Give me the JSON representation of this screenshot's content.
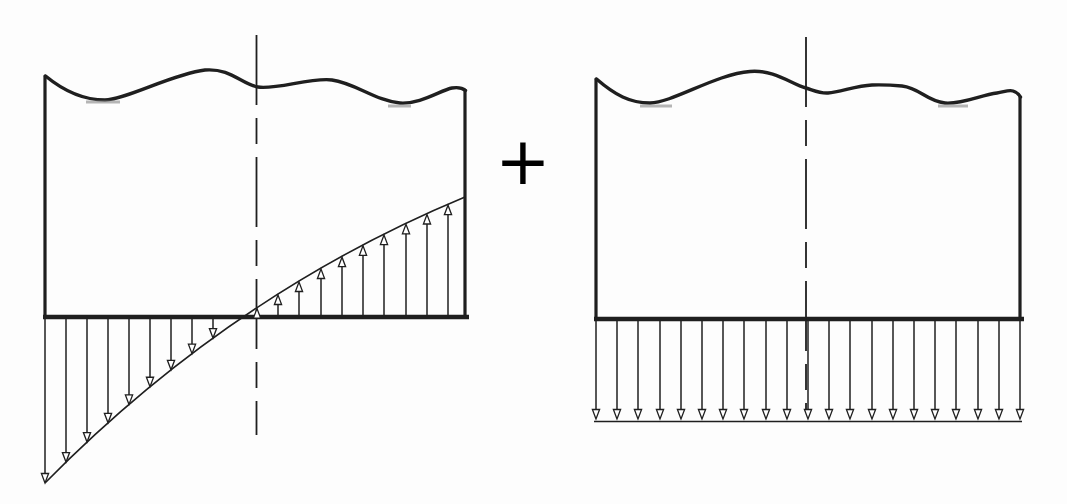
{
  "operator": {
    "label": "+"
  },
  "figure": {
    "bg": "#fdfdfd",
    "ink": "#1f1f1f",
    "faint": "#8f8f8f",
    "left_diagram": {
      "name": "moment-pressure-distribution",
      "block": {
        "left_x": 45,
        "right_x": 465,
        "bottom_y": 317,
        "left_top_y": 76,
        "right_top_y": 90,
        "bottom_overhang": [
          43,
          469
        ],
        "top_wavy_d": "M 45.5 76 C 65 92 85 100 105 100 C 128 99 172 74 205 70 C 231 68 241 84 258 87 C 276 90 312 77 332 80 C 355 83 376 101 400 103 C 420 104.5 441 90 452 88 C 458 87 462.5 88 465.5 90.5"
      },
      "centerline": {
        "x": 256.5,
        "y1": 35,
        "y2": 435,
        "dash": "70 13 26 13"
      },
      "envelope": {
        "p0": [
          45,
          483
        ],
        "c": [
          231,
          294
        ],
        "p2": [
          465,
          197
        ]
      },
      "arrows": {
        "down_xs": [
          45,
          66,
          87,
          108,
          129,
          150,
          171,
          192,
          213
        ],
        "up_xs": [
          257,
          278,
          299,
          321,
          342,
          363,
          384,
          406,
          427,
          448
        ]
      },
      "artifacts": [
        [
          86,
          102,
          120,
          102
        ],
        [
          388,
          106,
          411,
          106
        ]
      ]
    },
    "right_diagram": {
      "name": "uniform-pressure-distribution",
      "block": {
        "left_x": 596,
        "right_x": 1020,
        "bottom_y": 319,
        "left_top_y": 79,
        "right_top_y": 97,
        "bottom_overhang": [
          594,
          1024
        ],
        "top_wavy_d": "M 596.5 79 C 615 95 630 103 650 103 C 673 102.5 716 74 750 71.5 C 775 69.5 791 84 806 88 C 813 90 819 93.5 828 93 C 840 92.5 856 85.5 872 85 C 884 84.6 891 85 902 86 C 920 88 926 101 945 103 C 962 104.5 981 95 997 93 C 1004 92 1009 89.5 1013 91 C 1016.5 92.3 1019 94 1020.5 97"
      },
      "centerline": {
        "x": 806,
        "y1": 37,
        "y2": 413,
        "dash": "70 13 26 13"
      },
      "arrows": {
        "xs": [
          596,
          617,
          638,
          660,
          681,
          702,
          723,
          744,
          766,
          787,
          808,
          829,
          850,
          872,
          893,
          914,
          935,
          956,
          978,
          999,
          1020
        ],
        "shaft_top_y": 321,
        "tip_y": 419
      },
      "envelope_line": {
        "x1": 594,
        "x2": 1022,
        "y": 421.5
      },
      "artifacts": [
        [
          640,
          106,
          672,
          106
        ],
        [
          938,
          106,
          968,
          106
        ]
      ]
    }
  }
}
